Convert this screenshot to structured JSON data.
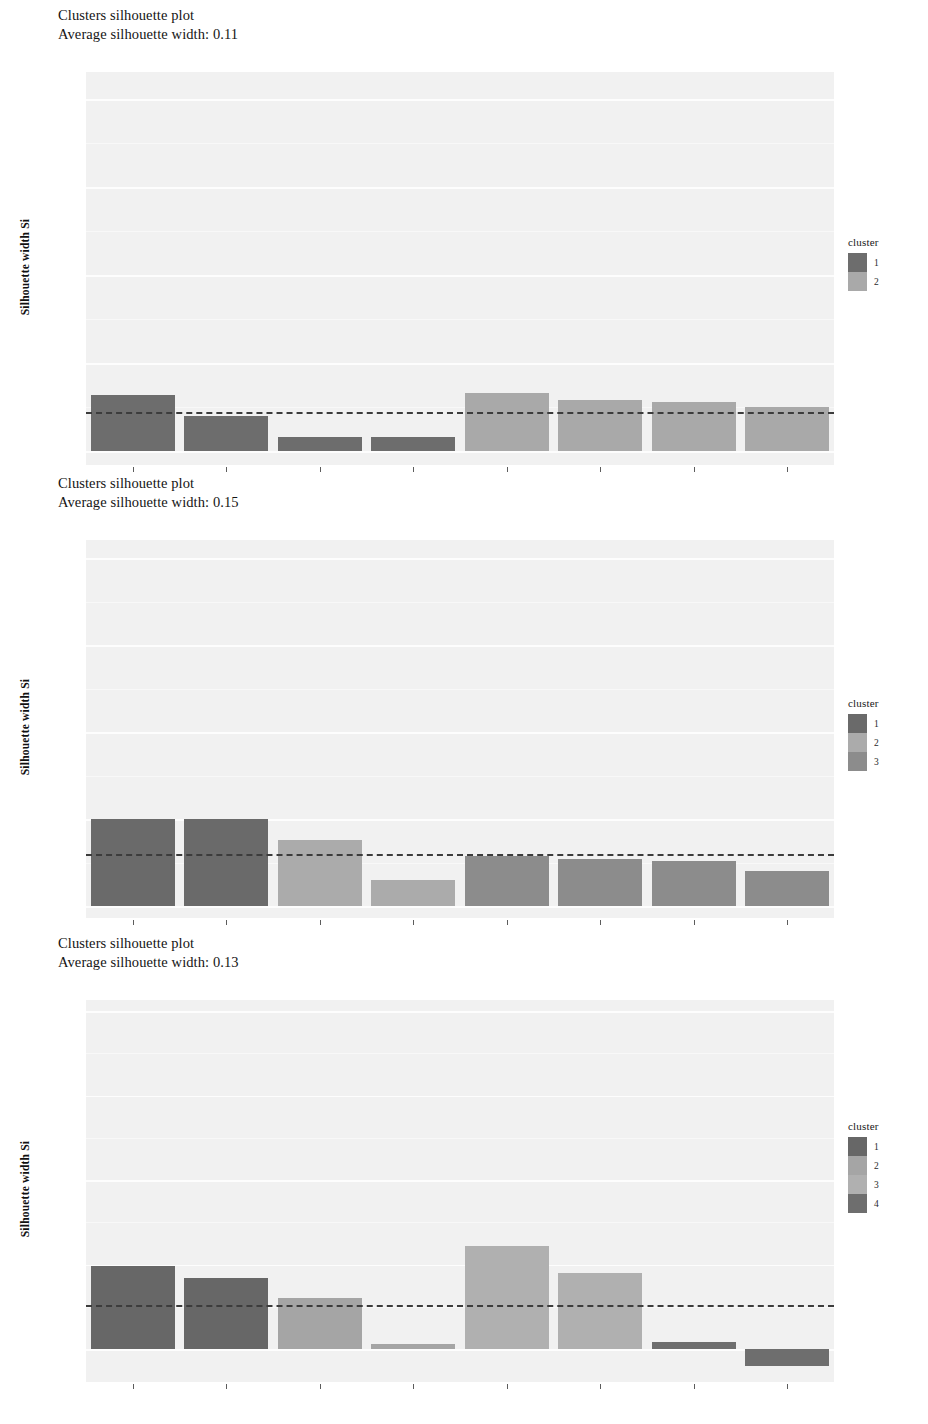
{
  "chart_data": [
    {
      "type": "bar",
      "title": "Clusters silhouette plot",
      "subtitle": "Average silhouette width: 0.11",
      "xlabel": "",
      "ylabel": "Silhouette width Si",
      "ylim": [
        -0.08,
        1.05
      ],
      "yticks": [
        "1.00",
        "0.75",
        "0.50",
        "0.25",
        "0.00"
      ],
      "ytickvalues": [
        1.0,
        0.75,
        0.5,
        0.25,
        0.0
      ],
      "grid": true,
      "legend_position": "right",
      "legend_title": "cluster",
      "average_silhouette_width": 0.11,
      "categories": [
        "",
        "",
        "",
        "",
        "",
        "",
        "",
        ""
      ],
      "values": [
        0.16,
        0.1,
        0.04,
        0.04,
        0.165,
        0.145,
        0.14,
        0.125
      ],
      "cluster_of_bar": [
        1,
        1,
        1,
        1,
        2,
        2,
        2,
        2
      ],
      "series": [
        {
          "name": "1",
          "color": "#6d6d6d"
        },
        {
          "name": "2",
          "color": "#a9a9a9"
        }
      ]
    },
    {
      "type": "bar",
      "title": "Clusters silhouette plot",
      "subtitle": "Average silhouette width: 0.15",
      "xlabel": "",
      "ylabel": "Silhouette width Si",
      "ylim": [
        -0.04,
        1.05
      ],
      "yticks": [
        "1.00",
        "0.75",
        "0.50",
        "0.25",
        "0.00"
      ],
      "ytickvalues": [
        1.0,
        0.75,
        0.5,
        0.25,
        0.0
      ],
      "grid": true,
      "legend_position": "right",
      "legend_title": "cluster",
      "average_silhouette_width": 0.15,
      "categories": [
        "",
        "",
        "",
        "",
        "",
        "",
        "",
        ""
      ],
      "values": [
        0.25,
        0.25,
        0.19,
        0.075,
        0.145,
        0.135,
        0.13,
        0.1
      ],
      "cluster_of_bar": [
        1,
        1,
        2,
        2,
        3,
        3,
        3,
        3
      ],
      "series": [
        {
          "name": "1",
          "color": "#6a6a6a"
        },
        {
          "name": "2",
          "color": "#ababab"
        },
        {
          "name": "3",
          "color": "#8c8c8c"
        }
      ]
    },
    {
      "type": "bar",
      "title": "Clusters silhouette plot",
      "subtitle": "Average silhouette width: 0.13",
      "xlabel": "",
      "ylabel": "Silhouette width Si",
      "ylim": [
        -0.09,
        1.05
      ],
      "yticks": [
        "1.00",
        "0.75",
        "0.50",
        "0.25",
        "0.00"
      ],
      "ytickvalues": [
        1.0,
        0.75,
        0.5,
        0.25,
        0.0
      ],
      "grid": true,
      "legend_position": "right",
      "legend_title": "cluster",
      "average_silhouette_width": 0.13,
      "categories": [
        "",
        "",
        "",
        "",
        "",
        "",
        "",
        ""
      ],
      "values": [
        0.245,
        0.21,
        0.15,
        0.015,
        0.305,
        0.225,
        0.02,
        -0.05
      ],
      "cluster_of_bar": [
        1,
        1,
        2,
        2,
        3,
        3,
        4,
        4
      ],
      "series": [
        {
          "name": "1",
          "color": "#676767"
        },
        {
          "name": "2",
          "color": "#a5a5a5"
        },
        {
          "name": "3",
          "color": "#b0b0b0"
        },
        {
          "name": "4",
          "color": "#6e6e6e"
        }
      ]
    }
  ],
  "plots": [
    {
      "title": "Clusters silhouette plot",
      "subtitle": "Average silhouette width: 0.11",
      "ylabel": "Silhouette width Si",
      "legend_title": "cluster"
    },
    {
      "title": "Clusters silhouette plot",
      "subtitle": "Average silhouette width: 0.15",
      "ylabel": "Silhouette width Si",
      "legend_title": "cluster"
    },
    {
      "title": "Clusters silhouette plot",
      "subtitle": "Average silhouette width: 0.13",
      "ylabel": "Silhouette width Si",
      "legend_title": "cluster"
    }
  ],
  "geometry": [
    {
      "panel_left": 86,
      "panel_top": 72,
      "panel_width": 748,
      "panel_height": 393,
      "zero_y": 451,
      "unit_px": 352,
      "legend_left": 848,
      "legend_top": 236
    },
    {
      "panel_left": 86,
      "panel_top": 540,
      "panel_width": 748,
      "panel_height": 378,
      "zero_y": 906,
      "unit_px": 348,
      "legend_left": 848,
      "legend_top": 697
    },
    {
      "panel_left": 86,
      "panel_top": 1000,
      "panel_width": 748,
      "panel_height": 382,
      "zero_y": 1349,
      "unit_px": 338,
      "legend_left": 848,
      "legend_top": 1120
    }
  ]
}
